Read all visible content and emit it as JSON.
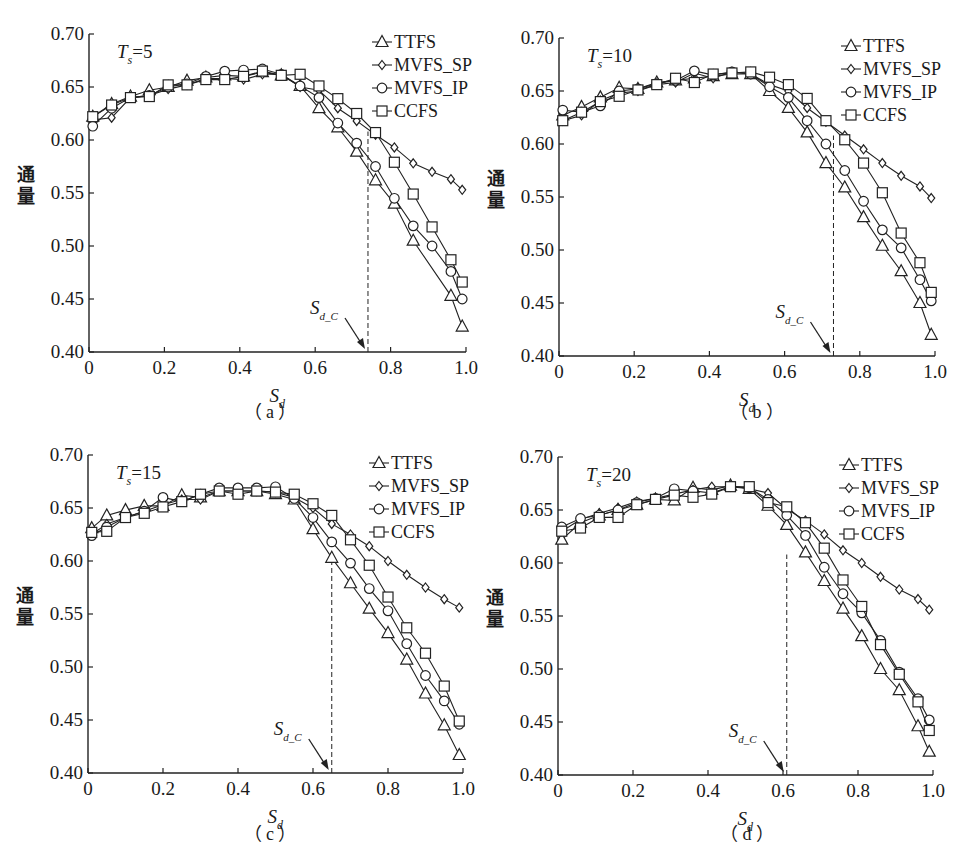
{
  "figure": {
    "ylabel": "通量",
    "xlabel": "S",
    "xlabel_sub": "d",
    "sdc_label": "S",
    "sdc_sub": "d_C",
    "legend": [
      {
        "name": "TTFS",
        "marker": "triangle"
      },
      {
        "name": "MVFS_SP",
        "marker": "diamond"
      },
      {
        "name": "MVFS_IP",
        "marker": "circle"
      },
      {
        "name": "CCFS",
        "marker": "square"
      }
    ],
    "x_ticks": [
      "0",
      "0.2",
      "0.4",
      "0.6",
      "0.8",
      "1.0"
    ],
    "y_ticks": [
      "0.40",
      "0.45",
      "0.50",
      "0.55",
      "0.60",
      "0.65",
      "0.70"
    ]
  },
  "chart_data": [
    {
      "type": "line",
      "panel": "a",
      "caption": "（ a ）",
      "title": "Ts=5",
      "title_main": "T",
      "title_sub": "s",
      "title_value": "=5",
      "xlabel": "S_d",
      "ylabel": "通量",
      "xlim": [
        0,
        1.0
      ],
      "ylim": [
        0.4,
        0.7
      ],
      "legend_position": "upper right",
      "grid": false,
      "critical_point": {
        "label": "S_d_C",
        "x": 0.74
      },
      "x": [
        0.01,
        0.06,
        0.11,
        0.16,
        0.21,
        0.26,
        0.31,
        0.36,
        0.41,
        0.46,
        0.51,
        0.56,
        0.61,
        0.66,
        0.71,
        0.76,
        0.81,
        0.86,
        0.91,
        0.96,
        0.99
      ],
      "series": [
        {
          "name": "TTFS",
          "values": [
            0.622,
            0.634,
            0.641,
            0.647,
            0.65,
            0.656,
            0.659,
            0.661,
            0.66,
            0.664,
            0.661,
            0.651,
            0.63,
            0.612,
            0.589,
            0.562,
            0.54,
            0.505,
            null,
            0.453,
            0.424
          ]
        },
        {
          "name": "MVFS_SP",
          "values": [
            0.619,
            0.621,
            0.64,
            0.642,
            0.648,
            0.652,
            0.658,
            0.658,
            0.657,
            0.662,
            0.662,
            0.65,
            0.647,
            0.63,
            0.618,
            0.605,
            0.593,
            0.578,
            0.57,
            0.563,
            0.553
          ]
        },
        {
          "name": "MVFS_IP",
          "values": [
            0.613,
            0.63,
            0.64,
            0.642,
            0.65,
            0.653,
            0.66,
            0.665,
            0.666,
            0.667,
            0.662,
            0.651,
            0.64,
            0.616,
            0.597,
            0.575,
            0.545,
            0.519,
            0.5,
            0.476,
            0.45
          ]
        },
        {
          "name": "CCFS",
          "values": [
            0.622,
            0.633,
            0.64,
            0.641,
            0.652,
            0.652,
            0.657,
            0.657,
            0.66,
            0.665,
            0.661,
            0.662,
            0.651,
            0.639,
            0.625,
            0.607,
            0.579,
            0.549,
            0.518,
            0.487,
            0.466
          ]
        }
      ]
    },
    {
      "type": "line",
      "panel": "b",
      "caption": "（ b ）",
      "title": "Ts=10",
      "title_main": "T",
      "title_sub": "s",
      "title_value": "=10",
      "xlabel": "S_d",
      "ylabel": "通量",
      "xlim": [
        0,
        1.0
      ],
      "ylim": [
        0.4,
        0.7
      ],
      "legend_position": "upper right",
      "grid": false,
      "critical_point": {
        "label": "S_d_C",
        "x": 0.73
      },
      "x": [
        0.01,
        0.06,
        0.11,
        0.16,
        0.21,
        0.26,
        0.31,
        0.36,
        0.41,
        0.46,
        0.51,
        0.56,
        0.61,
        0.66,
        0.71,
        0.76,
        0.81,
        0.86,
        0.91,
        0.96,
        0.99
      ],
      "series": [
        {
          "name": "TTFS",
          "values": [
            0.627,
            0.635,
            0.644,
            0.653,
            0.652,
            0.658,
            0.66,
            0.662,
            0.664,
            0.666,
            0.666,
            0.65,
            0.634,
            0.611,
            0.582,
            0.559,
            0.531,
            0.504,
            0.48,
            0.45,
            0.42
          ]
        },
        {
          "name": "MVFS_SP",
          "values": [
            0.622,
            0.627,
            0.641,
            0.648,
            0.65,
            0.656,
            0.658,
            0.667,
            0.662,
            0.668,
            0.666,
            0.656,
            0.65,
            0.634,
            0.621,
            0.608,
            0.595,
            0.582,
            0.57,
            0.56,
            0.549
          ]
        },
        {
          "name": "MVFS_IP",
          "values": [
            0.632,
            0.63,
            0.636,
            0.65,
            0.652,
            0.657,
            0.66,
            0.669,
            0.665,
            0.668,
            0.666,
            0.654,
            0.644,
            0.622,
            0.6,
            0.575,
            0.546,
            0.519,
            0.502,
            0.472,
            0.452
          ]
        },
        {
          "name": "CCFS",
          "values": [
            0.622,
            0.63,
            0.64,
            0.645,
            0.651,
            0.656,
            0.662,
            0.658,
            0.666,
            0.667,
            0.668,
            0.663,
            0.656,
            0.643,
            0.622,
            0.604,
            0.582,
            0.554,
            0.516,
            0.488,
            0.46
          ]
        }
      ]
    },
    {
      "type": "line",
      "panel": "c",
      "caption": "（ c ）",
      "title": "Ts=15",
      "title_main": "T",
      "title_sub": "s",
      "title_value": "=15",
      "xlabel": "S_d",
      "ylabel": "通量",
      "xlim": [
        0,
        1.0
      ],
      "ylim": [
        0.4,
        0.7
      ],
      "legend_position": "upper right",
      "grid": false,
      "critical_point": {
        "label": "S_d_C",
        "x": 0.65
      },
      "x": [
        0.01,
        0.05,
        0.1,
        0.15,
        0.2,
        0.25,
        0.3,
        0.35,
        0.4,
        0.45,
        0.5,
        0.55,
        0.6,
        0.65,
        0.7,
        0.75,
        0.8,
        0.85,
        0.9,
        0.95,
        0.99
      ],
      "series": [
        {
          "name": "TTFS",
          "values": [
            0.631,
            0.643,
            0.648,
            0.652,
            0.652,
            0.662,
            0.66,
            0.666,
            0.666,
            0.666,
            0.663,
            0.658,
            0.63,
            0.603,
            0.579,
            0.555,
            0.532,
            0.507,
            0.475,
            0.445,
            0.417
          ]
        },
        {
          "name": "MVFS_SP",
          "values": [
            0.625,
            0.635,
            0.641,
            0.647,
            0.653,
            0.658,
            0.658,
            0.666,
            0.666,
            0.666,
            0.665,
            0.66,
            0.65,
            0.635,
            0.625,
            0.614,
            0.6,
            0.587,
            0.575,
            0.564,
            0.556
          ]
        },
        {
          "name": "MVFS_IP",
          "values": [
            0.624,
            0.632,
            0.641,
            0.647,
            0.66,
            0.656,
            0.663,
            0.669,
            0.669,
            0.669,
            0.67,
            0.659,
            0.641,
            0.618,
            0.598,
            0.574,
            0.553,
            0.522,
            0.492,
            0.468,
            0.446
          ]
        },
        {
          "name": "CCFS",
          "values": [
            0.627,
            0.628,
            0.641,
            0.645,
            0.651,
            0.656,
            0.663,
            0.666,
            0.663,
            0.666,
            0.665,
            0.663,
            0.654,
            0.643,
            0.62,
            0.596,
            0.566,
            0.537,
            0.513,
            0.482,
            0.449
          ]
        }
      ]
    },
    {
      "type": "line",
      "panel": "d",
      "caption": "（ d ）",
      "title": "Ts=20",
      "title_main": "T",
      "title_sub": "s",
      "title_value": "=20",
      "xlabel": "S_d",
      "ylabel": "通量",
      "xlim": [
        0,
        1.0
      ],
      "ylim": [
        0.4,
        0.7
      ],
      "legend_position": "upper right",
      "grid": false,
      "critical_point": {
        "label": "S_d_C",
        "x": 0.61
      },
      "x": [
        0.01,
        0.06,
        0.11,
        0.16,
        0.21,
        0.26,
        0.31,
        0.36,
        0.41,
        0.46,
        0.51,
        0.56,
        0.61,
        0.66,
        0.71,
        0.76,
        0.81,
        0.86,
        0.91,
        0.96,
        0.99
      ],
      "series": [
        {
          "name": "TTFS",
          "values": [
            0.622,
            0.638,
            0.645,
            0.65,
            0.655,
            0.66,
            0.659,
            0.671,
            0.669,
            0.673,
            0.67,
            0.654,
            0.636,
            0.61,
            0.583,
            0.557,
            0.531,
            0.5,
            0.48,
            0.446,
            0.422
          ]
        },
        {
          "name": "MVFS_SP",
          "values": [
            0.63,
            0.641,
            0.647,
            0.652,
            0.658,
            0.661,
            0.665,
            0.669,
            0.672,
            0.672,
            0.67,
            0.666,
            0.651,
            0.64,
            0.627,
            0.612,
            0.6,
            0.587,
            0.575,
            0.566,
            0.556
          ]
        },
        {
          "name": "MVFS_IP",
          "values": [
            0.634,
            0.642,
            0.645,
            0.65,
            0.657,
            0.661,
            0.67,
            0.668,
            0.666,
            0.672,
            0.671,
            0.66,
            0.645,
            0.626,
            0.596,
            0.571,
            0.553,
            0.527,
            0.497,
            0.472,
            0.452
          ]
        },
        {
          "name": "CCFS",
          "values": [
            0.63,
            0.633,
            0.643,
            0.643,
            0.655,
            0.66,
            0.664,
            0.662,
            0.665,
            0.672,
            0.672,
            0.657,
            0.653,
            0.638,
            0.614,
            0.584,
            0.559,
            0.523,
            0.495,
            0.469,
            0.442
          ]
        }
      ]
    }
  ]
}
